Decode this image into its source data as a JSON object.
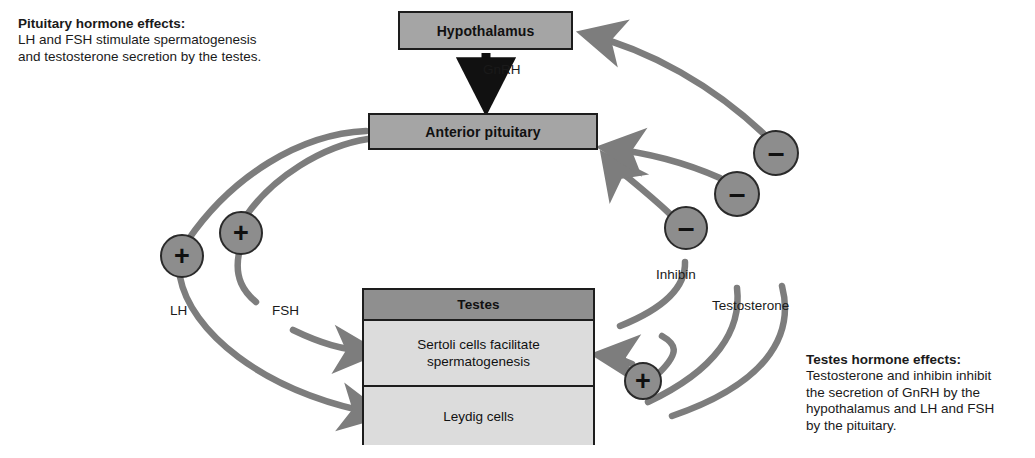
{
  "notes": {
    "pituitary": {
      "heading": "Pituitary hormone effects:",
      "line1": "LH and FSH stimulate spermatogenesis",
      "line2": "and testosterone secretion by the testes."
    },
    "testes": {
      "heading": "Testes hormone effects:",
      "line1": "Testosterone and inhibin inhibit",
      "line2": "the secretion of GnRH by the",
      "line3": "hypothalamus and LH and FSH",
      "line4": "by the pituitary."
    }
  },
  "boxes": {
    "hypothalamus": "Hypothalamus",
    "anterior_pituitary": "Anterior pituitary",
    "testes_title": "Testes",
    "sertoli_line1": "Sertoli cells facilitate",
    "sertoli_line2": "spermatogenesis",
    "leydig": "Leydig cells"
  },
  "labels": {
    "gnrh": "GnRH",
    "lh": "LH",
    "fsh": "FSH",
    "inhibin": "Inhibin",
    "testosterone": "Testosterone"
  },
  "signs": {
    "plus": "+",
    "minus": "–"
  },
  "colors": {
    "box_fill": "#a5a5a5",
    "testes_header_fill": "#8f8f8f",
    "testes_cell_fill": "#dcdcdc",
    "node_fill": "#8d8d8d",
    "arrow_gray": "#7d7d7d",
    "arrow_black": "#111111",
    "border": "#1d1d1d",
    "text": "#1a1a1a"
  }
}
